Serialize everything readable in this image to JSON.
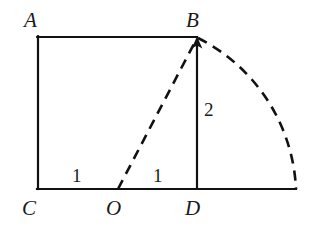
{
  "figure": {
    "width": 310,
    "height": 231,
    "background_color": "#ffffff",
    "stroke_color": "#111111",
    "solid_stroke_width": 2.2,
    "dashed_stroke_width": 2.6,
    "dash_pattern": "10 7"
  },
  "points": {
    "A": {
      "label": "A",
      "x": 38,
      "y": 37,
      "label_x": 24,
      "label_y": 10
    },
    "B": {
      "label": "B",
      "x": 197,
      "y": 37,
      "label_x": 186,
      "label_y": 10
    },
    "C": {
      "label": "C",
      "x": 38,
      "y": 189,
      "label_x": 22,
      "label_y": 198
    },
    "O": {
      "label": "O",
      "x": 118,
      "y": 189,
      "label_x": 106,
      "label_y": 198
    },
    "D": {
      "label": "D",
      "x": 197,
      "y": 189,
      "label_x": 185,
      "label_y": 198
    },
    "E": {
      "label": "",
      "x": 296,
      "y": 189,
      "label_x": 0,
      "label_y": 0
    }
  },
  "measures": {
    "co_length": {
      "text": "1",
      "x": 72,
      "y": 166
    },
    "od_length": {
      "text": "1",
      "x": 153,
      "y": 166
    },
    "bd_length": {
      "text": "2",
      "x": 204,
      "y": 100
    }
  },
  "segments": {
    "left_side_AC": {
      "from": "A",
      "to": "C",
      "style": "solid"
    },
    "top_side_AB": {
      "from": "A",
      "to": "B",
      "style": "solid"
    },
    "right_side_BD": {
      "from": "B",
      "to": "D",
      "style": "solid",
      "arrow": "to-B"
    },
    "base_CE": {
      "from": "C",
      "to": "E",
      "style": "solid"
    },
    "radius_OB": {
      "from": "O",
      "to": "B",
      "style": "dashed",
      "arrow": "to-B"
    }
  },
  "arc": {
    "center": "O",
    "from": "B",
    "to": "E",
    "radius": 178,
    "style": "dashed"
  }
}
